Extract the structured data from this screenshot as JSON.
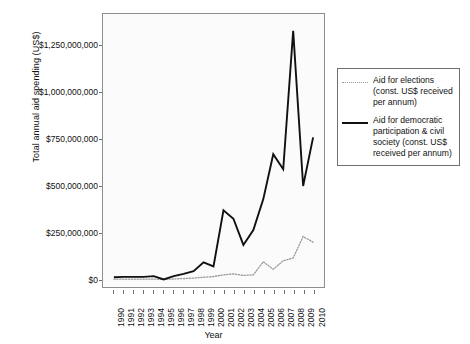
{
  "chart_data": {
    "type": "line",
    "title": "",
    "xlabel": "Year",
    "ylabel": "Total annual aid spending (US$)",
    "grid": false,
    "legend_position": "right",
    "xlim": [
      1990,
      2010
    ],
    "ylim": [
      -40000000,
      1420000000
    ],
    "ytick_values": [
      0,
      250000000,
      500000000,
      750000000,
      1000000000,
      1250000000
    ],
    "ytick_labels": [
      "$0",
      "$250,000,000",
      "$500,000,000",
      "$750,000,000",
      "$1,000,000,000",
      "$1,250,000,000"
    ],
    "x": [
      1990,
      1991,
      1992,
      1993,
      1994,
      1995,
      1996,
      1997,
      1998,
      1999,
      2000,
      2001,
      2002,
      2003,
      2004,
      2005,
      2006,
      2007,
      2008,
      2009,
      2010
    ],
    "xtick_labels": [
      "1990",
      "1991",
      "1992",
      "1993",
      "1994",
      "1995",
      "1996",
      "1997",
      "1998",
      "1999",
      "2000",
      "2001",
      "2002",
      "2003",
      "2004",
      "2005",
      "2006",
      "2007",
      "2008",
      "2009",
      "2010"
    ],
    "series": [
      {
        "name": "Aid for elections (const. US$ received per annum)",
        "style": "dotted",
        "color": "#9a9a9a",
        "values": [
          2000000,
          2000000,
          2000000,
          2000000,
          2000000,
          1000000,
          3000000,
          5000000,
          8000000,
          12000000,
          16000000,
          25000000,
          30000000,
          22000000,
          25000000,
          95000000,
          55000000,
          100000000,
          115000000,
          230000000,
          200000000
        ]
      },
      {
        "name": "Aid for democratic participation & civil society (const. US$ received per annum)",
        "style": "solid",
        "color": "#111111",
        "values": [
          12000000,
          14000000,
          14000000,
          14000000,
          18000000,
          0,
          18000000,
          30000000,
          45000000,
          92000000,
          70000000,
          370000000,
          325000000,
          185000000,
          265000000,
          430000000,
          670000000,
          590000000,
          1330000000,
          500000000,
          760000000
        ]
      }
    ]
  },
  "legend": {
    "items": [
      {
        "label": "Aid for elections (const. US$ received per annum)",
        "style": "dotted"
      },
      {
        "label": "Aid for democratic participation & civil society (const. US$ received per annum)",
        "style": "solid"
      }
    ]
  }
}
